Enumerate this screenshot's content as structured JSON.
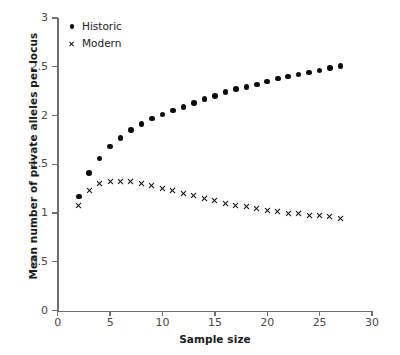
{
  "chart_data": {
    "type": "scatter",
    "title": "",
    "xlabel": "Sample size",
    "ylabel": "Mean number of private alleles per locus",
    "xlim": [
      0,
      30
    ],
    "ylim": [
      0,
      3
    ],
    "xticks": [
      0,
      5,
      10,
      15,
      20,
      25,
      30
    ],
    "yticks": [
      0,
      0.5,
      1,
      1.5,
      2,
      2.5,
      3
    ],
    "xtick_labels": [
      "0",
      "5",
      "10",
      "15",
      "20",
      "25",
      "30"
    ],
    "ytick_labels": [
      "0",
      "0.5",
      "1",
      "1.5",
      "2",
      "2.5",
      "3"
    ],
    "grid": false,
    "legend_position": "top-left",
    "series": [
      {
        "name": "Historic",
        "marker": "filled-circle",
        "color": "#0d0d0d",
        "x": [
          2,
          3,
          4,
          5,
          6,
          7,
          8,
          9,
          10,
          11,
          12,
          13,
          14,
          15,
          16,
          17,
          18,
          19,
          20,
          21,
          22,
          23,
          24,
          25,
          26,
          27
        ],
        "values": [
          1.17,
          1.41,
          1.56,
          1.68,
          1.77,
          1.85,
          1.91,
          1.97,
          2.01,
          2.05,
          2.09,
          2.13,
          2.17,
          2.2,
          2.24,
          2.27,
          2.29,
          2.32,
          2.35,
          2.38,
          2.4,
          2.42,
          2.44,
          2.46,
          2.49,
          2.51
        ]
      },
      {
        "name": "Modern",
        "marker": "x",
        "color": "#0d0d0d",
        "x": [
          2,
          3,
          4,
          5,
          6,
          7,
          8,
          9,
          10,
          11,
          12,
          13,
          14,
          15,
          16,
          17,
          18,
          19,
          20,
          21,
          22,
          23,
          24,
          25,
          26,
          27
        ],
        "values": [
          1.08,
          1.23,
          1.3,
          1.325,
          1.325,
          1.32,
          1.3,
          1.285,
          1.255,
          1.23,
          1.2,
          1.175,
          1.15,
          1.125,
          1.1,
          1.08,
          1.065,
          1.045,
          1.03,
          1.015,
          1.0,
          0.99,
          0.975,
          0.97,
          0.96,
          0.945
        ]
      }
    ]
  },
  "legend": {
    "items": [
      {
        "label": "Historic",
        "marker": "filled-circle"
      },
      {
        "label": "Modern",
        "marker": "x"
      }
    ]
  }
}
